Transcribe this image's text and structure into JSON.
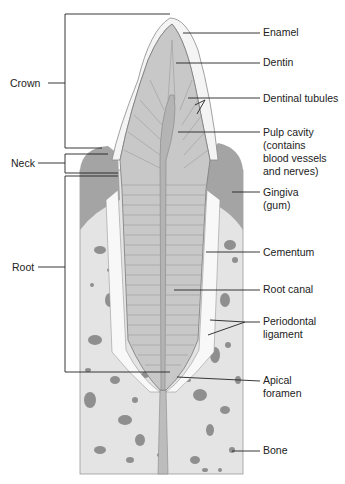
{
  "diagram": {
    "colors": {
      "enamel": "#f4f4f4",
      "enamel_edge": "#8a8a8a",
      "dentin": "#c8c8c8",
      "dentin_lines": "#8e8e8e",
      "pulp": "#b4b4b4",
      "gingiva": "#9e9e9e",
      "bone": "#e4e4e4",
      "bone_spots": "#8f8f8f",
      "ligament": "#f8f8f8",
      "leader": "#222222"
    },
    "left_labels": [
      {
        "id": "crown",
        "text": "Crown"
      },
      {
        "id": "neck",
        "text": "Neck"
      },
      {
        "id": "root",
        "text": "Root"
      }
    ],
    "right_labels": [
      {
        "id": "enamel",
        "text": "Enamel"
      },
      {
        "id": "dentin",
        "text": "Dentin"
      },
      {
        "id": "dentinal-tubules",
        "text": "Dentinal tubules"
      },
      {
        "id": "pulp-cavity",
        "text": "Pulp cavity\n(contains\nblood vessels\nand nerves)"
      },
      {
        "id": "gingiva",
        "text": "Gingiva\n(gum)"
      },
      {
        "id": "cementum",
        "text": "Cementum"
      },
      {
        "id": "root-canal",
        "text": "Root canal"
      },
      {
        "id": "periodontal-ligament",
        "text": "Periodontal\nligament"
      },
      {
        "id": "apical-foramen",
        "text": "Apical\nforamen"
      },
      {
        "id": "bone",
        "text": "Bone"
      }
    ]
  }
}
